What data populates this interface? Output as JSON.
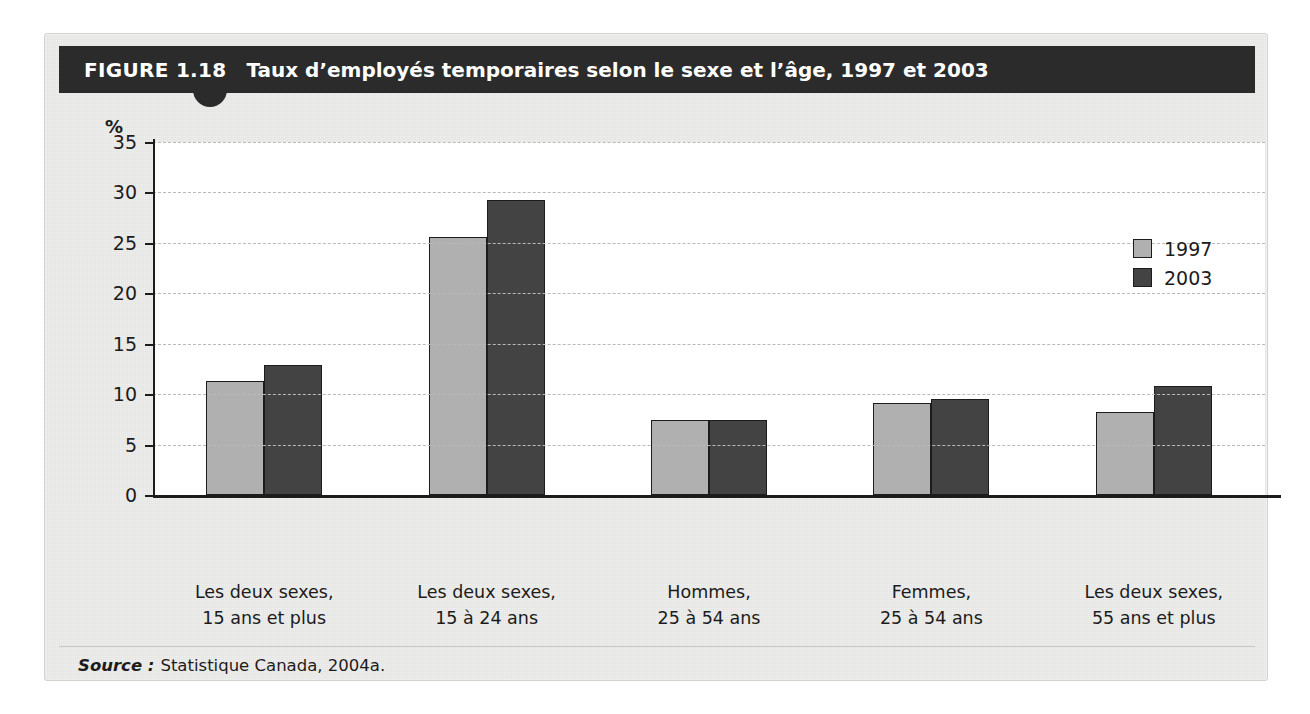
{
  "figure": {
    "number_label": "FIGURE 1.18",
    "title": "Taux d’employés temporaires selon le sexe et l’âge, 1997 et 2003",
    "source_label": "Source :",
    "source_text": "Statistique Canada, 2004a."
  },
  "colors": {
    "title_bar": "#2b2b2b",
    "panel_background": "#eeeeec",
    "plot_background": "#ffffff",
    "series_1997": "#b0b0b0",
    "series_2003": "#434343",
    "axis": "#1c1c1c",
    "gridline": "#b9b9b9"
  },
  "chart_data": {
    "type": "bar",
    "title": "Taux d’employés temporaires selon le sexe et l’âge, 1997 et 2003",
    "xlabel": "",
    "ylabel": "%",
    "ylim": [
      0,
      35
    ],
    "yticks": [
      0,
      5,
      10,
      15,
      20,
      25,
      30,
      35
    ],
    "ytick_labels": [
      "0",
      "5",
      "10",
      "15",
      "20",
      "25",
      "30",
      "35"
    ],
    "grid": true,
    "grid_axis": "y",
    "legend_position": "top-right",
    "categories": [
      "Les deux sexes,\n15 ans et plus",
      "Les deux sexes,\n15 à 24 ans",
      "Hommes,\n25 à 54 ans",
      "Femmes,\n25 à 54 ans",
      "Les deux sexes,\n55 ans et plus"
    ],
    "category_lines": [
      [
        "Les deux sexes,",
        "15 ans et plus"
      ],
      [
        "Les deux sexes,",
        "15 à 24 ans"
      ],
      [
        "Hommes,",
        "25 à 54 ans"
      ],
      [
        "Femmes,",
        "25 à 54 ans"
      ],
      [
        "Les deux sexes,",
        "55 ans et plus"
      ]
    ],
    "series": [
      {
        "name": "1997",
        "color": "#b0b0b0",
        "values": [
          11.3,
          25.6,
          7.4,
          9.1,
          8.2
        ]
      },
      {
        "name": "2003",
        "color": "#434343",
        "values": [
          12.9,
          29.3,
          7.4,
          9.5,
          10.8
        ]
      }
    ]
  }
}
